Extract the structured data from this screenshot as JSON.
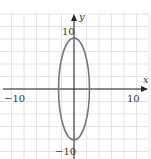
{
  "chart_data": {
    "type": "line",
    "title": "",
    "xlabel": "x",
    "ylabel": "y",
    "xlim": [
      -12,
      12
    ],
    "ylim": [
      -12,
      12
    ],
    "grid": true,
    "grid_step": 2,
    "tick_labels": {
      "x": [
        {
          "value": -10,
          "label": "−10"
        },
        {
          "value": 10,
          "label": "10"
        }
      ],
      "y": [
        {
          "value": 10,
          "label": "10"
        },
        {
          "value": -10,
          "label": "−10"
        }
      ]
    },
    "series": [
      {
        "name": "ellipse",
        "shape": "ellipse",
        "center": [
          0,
          0
        ],
        "semi_axis_x": 2.5,
        "semi_axis_y": 8,
        "color": "#777777"
      }
    ]
  },
  "labels": {
    "x_axis": "x",
    "y_axis": "y",
    "x_neg": "−10",
    "x_pos": "10",
    "y_pos": "10",
    "y_neg": "−10"
  },
  "colors": {
    "grid": "#dddddd",
    "axis": "#222222",
    "curve": "#777777"
  }
}
